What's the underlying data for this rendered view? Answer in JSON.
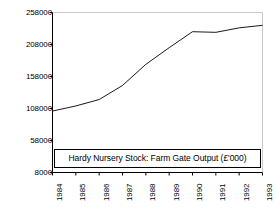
{
  "chart_data": {
    "type": "line",
    "title": "Hardy Nursery Stock: Farm Gate Output (£'000)",
    "xlabel": "",
    "ylabel": "",
    "grid": false,
    "legend": "none",
    "categories": [
      "1984",
      "1985",
      "1986",
      "1987",
      "1988",
      "1989",
      "1990",
      "1991",
      "1992",
      "1993"
    ],
    "x": [
      1984,
      1985,
      1986,
      1987,
      1988,
      1989,
      1990,
      1991,
      1992,
      1993
    ],
    "values": [
      104000,
      112000,
      122000,
      144000,
      177000,
      203000,
      228000,
      227000,
      234000,
      238000
    ],
    "yticks": [
      8000,
      58000,
      108000,
      158000,
      208000,
      258000
    ],
    "ytick_labels": [
      "8000",
      "58000",
      "108000",
      "158000",
      "208000",
      "258000"
    ],
    "ylim": [
      8000,
      258000
    ],
    "xlim": [
      1984,
      1993
    ],
    "series": [
      {
        "name": "Farm Gate Output",
        "values": [
          104000,
          112000,
          122000,
          144000,
          177000,
          203000,
          228000,
          227000,
          234000,
          238000
        ],
        "color": "#000000"
      }
    ],
    "annotations": [
      {
        "name": "title-box",
        "text": "Hardy Nursery Stock: Farm Gate Output (£'000)"
      }
    ]
  },
  "axes": {
    "line_color": "#000000",
    "tick_color": "#000000",
    "background": "#ffffff"
  }
}
